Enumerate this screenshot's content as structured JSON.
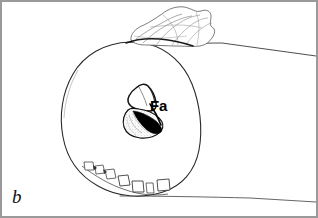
{
  "figure": {
    "panel_label": "b",
    "type": "scientific-line-drawing",
    "caption_visible": false,
    "background_color": "#ffffff",
    "ink_color": "#1a1a1a",
    "frame_color": "#9a9a9a",
    "width": 318,
    "height": 218
  },
  "labels": {
    "panel": "b",
    "structure_fa": "Fa"
  },
  "annotations": [
    {
      "text": "b",
      "name": "panel-letter",
      "style": "italic-serif",
      "x": 12,
      "y": 186
    },
    {
      "text": "Fa",
      "name": "structure-abbreviation",
      "style": "bold-sans",
      "x": 150,
      "y": 98
    }
  ],
  "drawing_elements": [
    {
      "name": "main-ovoid-body",
      "description": "large rounded ovoid outline occupying center-left of the panel",
      "fill": "#ffffff",
      "stroke": "#2a2a2a"
    },
    {
      "name": "crumpled-tissue-flap",
      "description": "irregular folded crumpled sheet draped over the top of the ovoid",
      "fill": "#ffffff",
      "stroke": "#555555"
    },
    {
      "name": "fa-upper-triangular-structure",
      "description": "open triangular outlined structure at center, unshaded",
      "fill": "#ffffff",
      "stroke": "#111111"
    },
    {
      "name": "fa-lower-shaded-structure",
      "description": "lower lobe with light stipple shading and a solid black wedge along its upper-right margin",
      "fill": "#e8e8e8",
      "stroke": "#111111",
      "accent": "#000000"
    },
    {
      "name": "tooth-row",
      "description": "row of small tooth-like polygonal elements along the lower-left margin of the ovoid",
      "fill": "#ffffff",
      "stroke": "#444444"
    },
    {
      "name": "upper-guide-line",
      "description": "thin straight line running from the tissue flap to the right frame edge",
      "stroke": "#3a3a3a"
    },
    {
      "name": "lower-guide-line",
      "description": "thin straight line running from the bottom of the ovoid to the right frame edge",
      "stroke": "#555555"
    }
  ],
  "colors": {
    "ink": "#1a1a1a",
    "light_ink": "#555555",
    "shading": "#e8e8e8",
    "solid_accent": "#000000",
    "frame": "#9a9a9a",
    "background": "#ffffff"
  }
}
